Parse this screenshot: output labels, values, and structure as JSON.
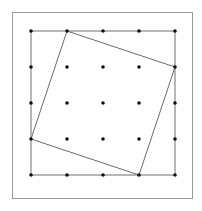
{
  "diagram": {
    "title": "",
    "grid": {
      "rows": 5,
      "cols": 5
    },
    "outer_square_corners": [
      [
        0,
        0
      ],
      [
        4,
        0
      ],
      [
        4,
        4
      ],
      [
        0,
        4
      ]
    ],
    "tilted_square_vertices": [
      [
        1,
        0
      ],
      [
        4,
        1
      ],
      [
        3,
        4
      ],
      [
        0,
        3
      ]
    ],
    "colors": {
      "frame": "#9a9a9a",
      "grid_square": "#6e6e6e",
      "tilted_square": "#6a6a6a",
      "dot": "#111111",
      "background": "#ffffff"
    }
  }
}
